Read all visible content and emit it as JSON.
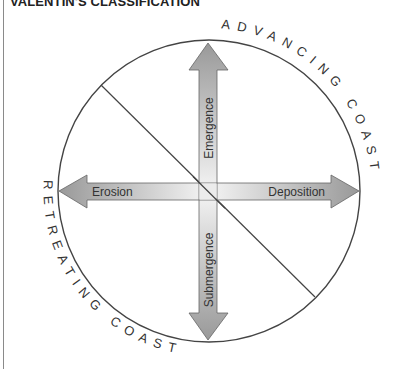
{
  "title": "VALENTIN'S CLASSIFICATION",
  "diagram": {
    "circle_labels": {
      "top_right": "ADVANCING COAST",
      "bottom_left": "RETREATING COAST"
    },
    "arrows": {
      "up": "Emergence",
      "down": "Submergence",
      "left": "Erosion",
      "right": "Deposition"
    },
    "colors": {
      "arrow_dark": "#9a9a9a",
      "arrow_light": "#eeeeee",
      "stroke": "#444444"
    }
  }
}
